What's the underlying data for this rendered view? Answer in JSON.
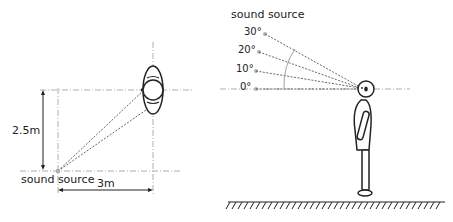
{
  "left_panel": {
    "title": "top view",
    "vertical_distance_label": "2.5m",
    "horizontal_distance_label": "3m",
    "source_label": "sound source"
  },
  "right_panel": {
    "title": "side view",
    "source_label": "sound source",
    "angles": [
      "30°",
      "20°",
      "10°",
      "0°"
    ]
  },
  "colors": {
    "line": "#222222",
    "dashed": "#555555",
    "centerline": "#9a9a9a",
    "source_dot": "#b0b0b0"
  }
}
